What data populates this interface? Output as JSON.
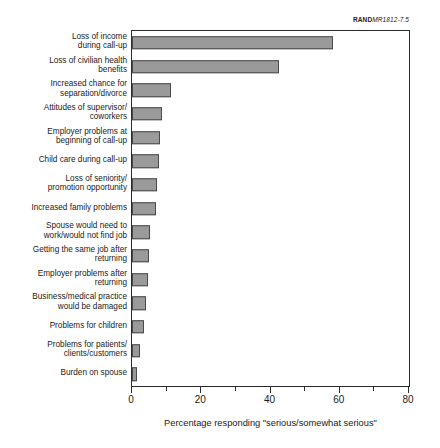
{
  "source_tag": {
    "prefix": "RAND",
    "code": "MR1812-7.5"
  },
  "chart_data": {
    "type": "bar",
    "orientation": "horizontal",
    "title": "",
    "xlabel": "Percentage responding \"serious/somewhat serious\"",
    "ylabel": "",
    "xlim": [
      0,
      80
    ],
    "xticks": [
      0,
      20,
      40,
      60,
      80
    ],
    "xtick_labels": [
      "0",
      "20",
      "40",
      "60",
      "80"
    ],
    "xminor_ticks": [
      10,
      30,
      50,
      70
    ],
    "grid": false,
    "legend": false,
    "bar_color": "#9a9a9a",
    "bar_edge_color": "#4a4a4a",
    "categories": [
      "Loss of income during call-up",
      "Loss of civilian health benefits",
      "Increased chance for separation/divorce",
      "Attitudes of supervisor/coworkers",
      "Employer problems at beginning of call-up",
      "Child care during call-up",
      "Loss of seniority/promotion opportunity",
      "Increased family problems",
      "Spouse would need to work/would not find job",
      "Getting the same job after returning",
      "Employer problems after returning",
      "Business/medical practice would be damaged",
      "Problems for children",
      "Problems for patients/clients/customers",
      "Burden on spouse"
    ],
    "category_lines": [
      [
        "Loss of income",
        "during call-up"
      ],
      [
        "Loss of civilian health",
        "benefits"
      ],
      [
        "Increased chance for",
        "separation/divorce"
      ],
      [
        "Attitudes of supervisor/",
        "coworkers"
      ],
      [
        "Employer problems at",
        "beginning of call-up"
      ],
      [
        "Child care during call-up"
      ],
      [
        "Loss of seniority/",
        "promotion opportunity"
      ],
      [
        "Increased family problems"
      ],
      [
        "Spouse would need to",
        "work/would not find job"
      ],
      [
        "Getting the same job after",
        "returning"
      ],
      [
        "Employer problems after",
        "returning"
      ],
      [
        "Business/medical practice",
        "would be damaged"
      ],
      [
        "Problems for children"
      ],
      [
        "Problems for patients/",
        "clients/customers"
      ],
      [
        "Burden on spouse"
      ]
    ],
    "values": [
      58,
      42.5,
      11.2,
      8.6,
      8.2,
      7.8,
      7.2,
      6.8,
      5.2,
      4.8,
      4.5,
      4.0,
      3.6,
      2.4,
      1.5
    ]
  }
}
